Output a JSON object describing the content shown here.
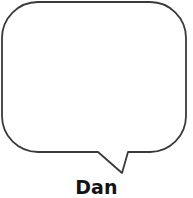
{
  "diagram": {
    "type": "speech-bubble",
    "bubble": {
      "content": "",
      "fill_color": "#ffffff",
      "stroke_color": "#3a3a3a",
      "stroke_width": 1.8,
      "corner_radius": 36,
      "bounds": {
        "x": 2,
        "y": 2,
        "width": 184,
        "height": 151
      },
      "tail": {
        "direction": "down",
        "left_base_x": 98,
        "right_base_x": 128,
        "base_y": 152,
        "tip_x": 122,
        "tip_y": 173
      }
    },
    "speaker": {
      "label": "Dan",
      "color": "#141414"
    }
  },
  "canvas": {
    "background": "#ffffff",
    "width": 193,
    "height": 198
  }
}
